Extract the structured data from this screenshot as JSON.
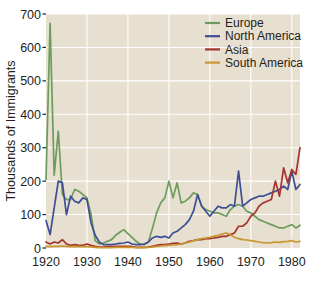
{
  "chart_data": {
    "type": "line",
    "title": "",
    "subtitle": "",
    "xlabel": "",
    "ylabel": "Thousands of Immigrants",
    "xlim": [
      1920,
      1982
    ],
    "ylim": [
      0,
      700
    ],
    "xticks": [
      1920,
      1930,
      1940,
      1950,
      1960,
      1970,
      1980
    ],
    "yticks": [
      0,
      100,
      200,
      300,
      400,
      500,
      600,
      700
    ],
    "xtick_labels": [
      "1920",
      "1930",
      "1940",
      "1950",
      "1960",
      "1970",
      "1980"
    ],
    "ytick_labels": [
      "0",
      "100",
      "200",
      "300",
      "400",
      "500",
      "600",
      "700"
    ],
    "grid": true,
    "grid_color": "#ffffff",
    "plot_background": "#e7dfcf",
    "legend_position": "top-right",
    "x": [
      1920,
      1921,
      1922,
      1923,
      1924,
      1925,
      1926,
      1927,
      1928,
      1929,
      1930,
      1931,
      1932,
      1933,
      1934,
      1935,
      1936,
      1937,
      1938,
      1939,
      1940,
      1941,
      1942,
      1943,
      1944,
      1945,
      1946,
      1947,
      1948,
      1949,
      1950,
      1951,
      1952,
      1953,
      1954,
      1955,
      1956,
      1957,
      1958,
      1959,
      1960,
      1961,
      1962,
      1963,
      1964,
      1965,
      1966,
      1967,
      1968,
      1969,
      1970,
      1971,
      1972,
      1973,
      1974,
      1975,
      1976,
      1977,
      1978,
      1979,
      1980,
      1981,
      1982
    ],
    "series": [
      {
        "name": "Europe",
        "color": "#6d9c5e",
        "values": [
          205,
          672,
          218,
          350,
          160,
          145,
          145,
          175,
          170,
          160,
          150,
          100,
          22,
          12,
          15,
          20,
          25,
          38,
          47,
          55,
          43,
          32,
          20,
          12,
          10,
          18,
          60,
          105,
          135,
          150,
          200,
          150,
          195,
          135,
          140,
          150,
          165,
          160,
          125,
          115,
          110,
          105,
          105,
          100,
          95,
          115,
          125,
          130,
          125,
          110,
          105,
          95,
          85,
          80,
          75,
          70,
          65,
          60,
          60,
          65,
          70,
          60,
          68
        ]
      },
      {
        "name": "North America",
        "color": "#3e4e95",
        "values": [
          82,
          40,
          120,
          200,
          195,
          100,
          155,
          140,
          135,
          150,
          145,
          75,
          38,
          18,
          10,
          10,
          10,
          12,
          14,
          15,
          18,
          12,
          10,
          10,
          12,
          18,
          30,
          35,
          32,
          35,
          30,
          45,
          50,
          60,
          70,
          85,
          110,
          160,
          125,
          110,
          95,
          110,
          125,
          120,
          120,
          130,
          125,
          230,
          125,
          135,
          145,
          150,
          155,
          155,
          160,
          165,
          170,
          175,
          185,
          175,
          230,
          175,
          190
        ]
      },
      {
        "name": "Asia",
        "color": "#a6332e",
        "values": [
          18,
          12,
          18,
          15,
          25,
          12,
          8,
          10,
          8,
          8,
          12,
          8,
          5,
          3,
          3,
          4,
          4,
          5,
          5,
          5,
          5,
          4,
          2,
          2,
          2,
          3,
          5,
          8,
          10,
          10,
          12,
          14,
          15,
          12,
          15,
          20,
          22,
          25,
          25,
          28,
          28,
          30,
          32,
          35,
          35,
          40,
          45,
          65,
          65,
          75,
          95,
          105,
          125,
          135,
          140,
          145,
          200,
          155,
          240,
          195,
          235,
          220,
          300
        ]
      },
      {
        "name": "South America",
        "color": "#c8972f",
        "values": [
          5,
          4,
          5,
          5,
          6,
          5,
          4,
          4,
          4,
          4,
          4,
          3,
          2,
          1,
          1,
          1,
          1,
          2,
          2,
          2,
          2,
          2,
          1,
          1,
          1,
          2,
          3,
          5,
          6,
          7,
          8,
          9,
          10,
          12,
          15,
          18,
          22,
          25,
          28,
          30,
          32,
          35,
          38,
          42,
          45,
          40,
          32,
          28,
          25,
          24,
          22,
          20,
          18,
          16,
          15,
          16,
          18,
          17,
          19,
          20,
          22,
          18,
          20
        ]
      }
    ]
  },
  "legend": {
    "entries": [
      {
        "label": "Europe"
      },
      {
        "label": "North America"
      },
      {
        "label": "Asia"
      },
      {
        "label": "South America"
      }
    ]
  }
}
